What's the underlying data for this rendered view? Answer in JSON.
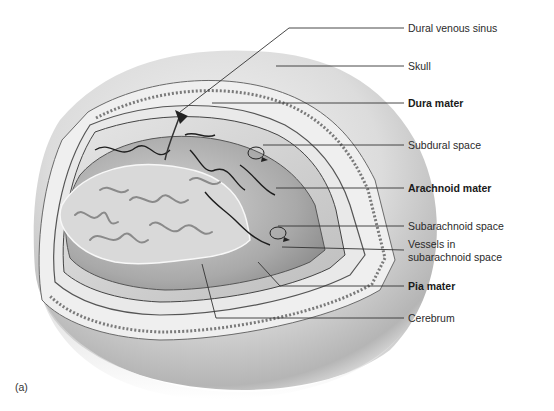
{
  "figure": {
    "panel_label": "(a)",
    "labels": [
      {
        "id": "dural-venous-sinus",
        "text": "Dural venous sinus",
        "bold": false
      },
      {
        "id": "skull",
        "text": "Skull",
        "bold": false
      },
      {
        "id": "dura-mater",
        "text": "Dura mater",
        "bold": true
      },
      {
        "id": "subdural-space",
        "text": "Subdural space",
        "bold": false
      },
      {
        "id": "arachnoid-mater",
        "text": "Arachnoid mater",
        "bold": true
      },
      {
        "id": "subarachnoid-space",
        "text": "Subarachnoid space",
        "bold": false
      },
      {
        "id": "vessels-line1",
        "text": "Vessels in",
        "bold": false
      },
      {
        "id": "vessels-line2",
        "text": "subarachnoid space",
        "bold": false
      },
      {
        "id": "pia-mater",
        "text": "Pia mater",
        "bold": true
      },
      {
        "id": "cerebrum",
        "text": "Cerebrum",
        "bold": false
      }
    ]
  }
}
